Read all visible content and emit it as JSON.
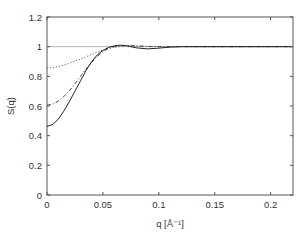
{
  "chart_data": {
    "type": "line",
    "title": "",
    "xlabel": "q [Å⁻¹]",
    "ylabel": "S(q)",
    "xlim": [
      0,
      0.22
    ],
    "ylim": [
      0,
      1.2
    ],
    "xticks": [
      0,
      0.05,
      0.1,
      0.15,
      0.2
    ],
    "xtick_labels": [
      "0",
      "0.05",
      "0.1",
      "0.15",
      "0.2"
    ],
    "yticks": [
      0,
      0.2,
      0.4,
      0.6,
      0.8,
      1.0,
      1.2
    ],
    "ytick_labels": [
      "0",
      "0.2",
      "0.4",
      "0.6",
      "0.8",
      "1",
      "1.2"
    ],
    "grid": false,
    "legend": null,
    "series": [
      {
        "name": "reference (S=1)",
        "style": "solid-thin",
        "color": "#999999",
        "x": [
          0,
          0.22
        ],
        "y": [
          1.0,
          1.0
        ]
      },
      {
        "name": "dotted",
        "style": "dotted",
        "color": "#666666",
        "x": [
          0,
          0.005,
          0.01,
          0.015,
          0.02,
          0.025,
          0.03,
          0.035,
          0.04,
          0.045,
          0.05,
          0.055,
          0.06,
          0.065,
          0.07,
          0.08,
          0.09,
          0.1,
          0.12,
          0.15,
          0.22
        ],
        "y": [
          0.855,
          0.858,
          0.865,
          0.875,
          0.888,
          0.902,
          0.917,
          0.932,
          0.948,
          0.963,
          0.977,
          0.988,
          0.996,
          1.0,
          1.003,
          1.003,
          1.001,
          1.0,
          1.0,
          1.0,
          1.0
        ]
      },
      {
        "name": "dash-dot",
        "style": "dashdot",
        "color": "#444444",
        "x": [
          0,
          0.005,
          0.01,
          0.015,
          0.02,
          0.025,
          0.03,
          0.035,
          0.04,
          0.045,
          0.05,
          0.055,
          0.06,
          0.065,
          0.07,
          0.08,
          0.09,
          0.1,
          0.12,
          0.15,
          0.22
        ],
        "y": [
          0.605,
          0.612,
          0.632,
          0.663,
          0.703,
          0.75,
          0.8,
          0.85,
          0.895,
          0.935,
          0.965,
          0.988,
          1.0,
          1.006,
          1.008,
          1.006,
          1.002,
          1.0,
          1.0,
          1.0,
          1.0
        ]
      },
      {
        "name": "solid",
        "style": "solid",
        "color": "#222222",
        "x": [
          0,
          0.005,
          0.01,
          0.015,
          0.02,
          0.025,
          0.03,
          0.035,
          0.04,
          0.045,
          0.05,
          0.055,
          0.06,
          0.065,
          0.07,
          0.075,
          0.08,
          0.09,
          0.1,
          0.11,
          0.12,
          0.15,
          0.22
        ],
        "y": [
          0.462,
          0.475,
          0.51,
          0.565,
          0.63,
          0.7,
          0.77,
          0.84,
          0.9,
          0.945,
          0.975,
          0.995,
          1.005,
          1.01,
          1.008,
          1.0,
          0.992,
          0.985,
          0.99,
          0.997,
          1.0,
          1.0,
          1.0
        ]
      }
    ]
  }
}
